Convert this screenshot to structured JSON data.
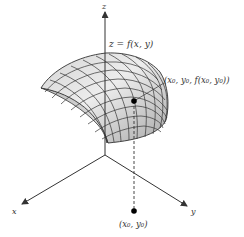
{
  "diagram": {
    "type": "3d-surface-plot",
    "axes": {
      "z_label": "z",
      "x_label": "x",
      "y_label": "y"
    },
    "surface_label": "z = f(x, y)",
    "surface_point_label": "(x₀, y₀, f(x₀, y₀))",
    "domain_point_label": "(x₀, y₀)",
    "colors": {
      "surface_fill_light": "#e6e6e6",
      "surface_fill_dark": "#a8a8a8",
      "grid_lines": "#333333",
      "axes": "#333333",
      "point": "#000000"
    }
  }
}
